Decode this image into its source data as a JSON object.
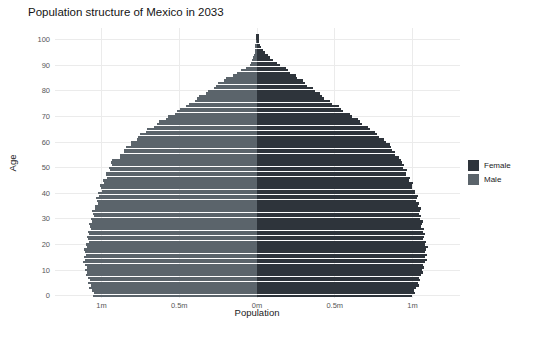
{
  "chart_data": {
    "type": "bar",
    "variant": "population-pyramid",
    "title": "Population structure of Mexico in 2033",
    "xlabel": "Population",
    "ylabel": "Age",
    "unit": "millions of people per single year of age",
    "x_ticks": [
      {
        "label": "1m",
        "value": -1.0
      },
      {
        "label": "0.5m",
        "value": -0.5
      },
      {
        "label": "0m",
        "value": 0.0
      },
      {
        "label": "0.5m",
        "value": 0.5
      },
      {
        "label": "1m",
        "value": 1.0
      }
    ],
    "y_ticks": [
      0,
      10,
      20,
      30,
      40,
      50,
      60,
      70,
      80,
      90,
      100
    ],
    "xlim": [
      -1.3,
      1.3
    ],
    "ylim": [
      0,
      100
    ],
    "grid": {
      "visible": true,
      "color": "#ebebeb",
      "minor": false
    },
    "background": "#ffffff",
    "legend": {
      "position": "right",
      "entries": [
        {
          "label": "Female",
          "color": "#2e343b"
        },
        {
          "label": "Male",
          "color": "#5b646b"
        }
      ]
    },
    "series": [
      {
        "name": "Male",
        "side": "left",
        "color": "#5b646b",
        "age_value_anchors": [
          [
            0,
            1.05
          ],
          [
            3,
            1.07
          ],
          [
            6,
            1.085
          ],
          [
            10,
            1.1
          ],
          [
            14,
            1.11
          ],
          [
            17,
            1.105
          ],
          [
            20,
            1.095
          ],
          [
            25,
            1.08
          ],
          [
            30,
            1.06
          ],
          [
            35,
            1.04
          ],
          [
            40,
            1.015
          ],
          [
            45,
            0.985
          ],
          [
            50,
            0.945
          ],
          [
            52,
            0.94
          ],
          [
            53,
            0.925
          ],
          [
            54,
            0.885
          ],
          [
            57,
            0.855
          ],
          [
            58,
            0.83
          ],
          [
            60,
            0.805
          ],
          [
            65,
            0.7
          ],
          [
            70,
            0.565
          ],
          [
            75,
            0.435
          ],
          [
            80,
            0.31
          ],
          [
            85,
            0.195
          ],
          [
            88,
            0.1
          ],
          [
            90,
            0.045
          ],
          [
            93,
            0.022
          ],
          [
            96,
            0.012
          ],
          [
            99,
            0.008
          ],
          [
            100,
            0.007
          ]
        ]
      },
      {
        "name": "Female",
        "side": "right",
        "color": "#2e343b",
        "age_value_anchors": [
          [
            0,
            1.0
          ],
          [
            3,
            1.025
          ],
          [
            6,
            1.045
          ],
          [
            10,
            1.065
          ],
          [
            14,
            1.085
          ],
          [
            17,
            1.09
          ],
          [
            20,
            1.085
          ],
          [
            25,
            1.07
          ],
          [
            30,
            1.055
          ],
          [
            35,
            1.04
          ],
          [
            40,
            1.02
          ],
          [
            45,
            0.985
          ],
          [
            50,
            0.945
          ],
          [
            52,
            0.94
          ],
          [
            53,
            0.925
          ],
          [
            54,
            0.9
          ],
          [
            57,
            0.875
          ],
          [
            60,
            0.835
          ],
          [
            65,
            0.73
          ],
          [
            70,
            0.615
          ],
          [
            75,
            0.49
          ],
          [
            80,
            0.375
          ],
          [
            85,
            0.265
          ],
          [
            88,
            0.2
          ],
          [
            90,
            0.15
          ],
          [
            93,
            0.085
          ],
          [
            95,
            0.05
          ],
          [
            97,
            0.028
          ],
          [
            99,
            0.014
          ],
          [
            100,
            0.012
          ]
        ]
      }
    ],
    "tip_marker_color": "#30363c"
  }
}
